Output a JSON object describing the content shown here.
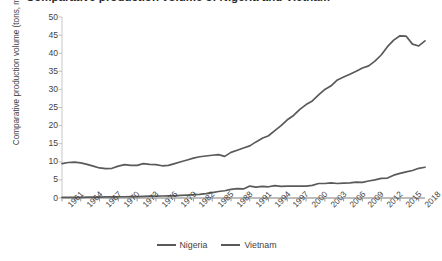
{
  "title_fragment": "Comparative production volume of Nigeria and Vietnam",
  "legend": {
    "items": [
      {
        "label": "Nigeria",
        "color": "#5a5a5a"
      },
      {
        "label": "Vietnam",
        "color": "#5a5a5a"
      }
    ]
  },
  "chart_data": {
    "type": "line",
    "title": "Comparative production volume of Nigeria and Vietnam",
    "xlabel": "",
    "ylabel": "Comparative production volume (tons, million)",
    "ylim": [
      0,
      50
    ],
    "ytick_step": 5,
    "yticks": [
      0,
      5,
      10,
      15,
      20,
      25,
      30,
      35,
      40,
      45,
      50
    ],
    "xlim": [
      1961,
      2019
    ],
    "xtick_labels": [
      "1961",
      "1964",
      "1967",
      "1970",
      "1973",
      "1976",
      "1979",
      "1982",
      "1985",
      "1988",
      "1991",
      "1994",
      "1997",
      "2000",
      "2003",
      "2006",
      "2009",
      "2012",
      "2015",
      "2018"
    ],
    "grid": false,
    "legend_position": "bottom",
    "x": [
      1961,
      1962,
      1963,
      1964,
      1965,
      1966,
      1967,
      1968,
      1969,
      1970,
      1971,
      1972,
      1973,
      1974,
      1975,
      1976,
      1977,
      1978,
      1979,
      1980,
      1981,
      1982,
      1983,
      1984,
      1985,
      1986,
      1987,
      1988,
      1989,
      1990,
      1991,
      1992,
      1993,
      1994,
      1995,
      1996,
      1997,
      1998,
      1999,
      2000,
      2001,
      2002,
      2003,
      2004,
      2005,
      2006,
      2007,
      2008,
      2009,
      2010,
      2011,
      2012,
      2013,
      2014,
      2015,
      2016,
      2017,
      2018,
      2019
    ],
    "series": [
      {
        "name": "Nigeria",
        "color": "#5a5a5a",
        "values": [
          0.2,
          0.2,
          0.2,
          0.2,
          0.25,
          0.25,
          0.25,
          0.3,
          0.3,
          0.35,
          0.35,
          0.4,
          0.4,
          0.45,
          0.5,
          0.5,
          0.55,
          0.6,
          0.6,
          0.7,
          0.8,
          0.9,
          1.0,
          1.2,
          1.5,
          1.8,
          2.0,
          2.4,
          2.6,
          2.5,
          3.3,
          3.0,
          3.2,
          3.1,
          3.4,
          3.2,
          3.3,
          3.3,
          3.3,
          3.3,
          3.5,
          4.0,
          4.0,
          4.2,
          4.0,
          4.1,
          4.2,
          4.4,
          4.3,
          4.7,
          5.0,
          5.4,
          5.5,
          6.3,
          6.8,
          7.2,
          7.6,
          8.2,
          8.5
        ]
      },
      {
        "name": "Vietnam",
        "color": "#5a5a5a",
        "values": [
          9.5,
          9.8,
          9.9,
          9.7,
          9.3,
          8.8,
          8.3,
          8.1,
          8.2,
          8.8,
          9.2,
          9.0,
          9.0,
          9.5,
          9.3,
          9.2,
          8.9,
          9.0,
          9.5,
          10.0,
          10.5,
          11.0,
          11.4,
          11.6,
          11.8,
          12.0,
          11.5,
          12.6,
          13.2,
          13.8,
          14.4,
          15.5,
          16.5,
          17.2,
          18.6,
          20.0,
          21.6,
          22.8,
          24.5,
          25.8,
          26.8,
          28.5,
          30.0,
          31.0,
          32.6,
          33.4,
          34.2,
          35.0,
          35.9,
          36.5,
          37.8,
          39.5,
          41.8,
          43.6,
          44.8,
          44.7,
          42.5,
          42.0,
          43.4
        ]
      }
    ]
  }
}
